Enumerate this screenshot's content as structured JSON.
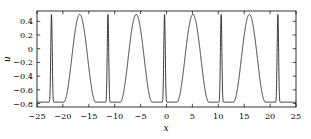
{
  "chart_data": {
    "type": "line",
    "title": "",
    "xlabel": "x",
    "ylabel": "u",
    "xlim": [
      -25,
      25
    ],
    "ylim": [
      -0.85,
      0.55
    ],
    "grid": false,
    "legend": false,
    "xticks": [
      -25,
      -20,
      -15,
      -10,
      -5,
      0,
      5,
      10,
      15,
      20,
      25
    ],
    "xticklabels": [
      "−25",
      "−20",
      "−15",
      "−10",
      "−5",
      "0",
      "5",
      "10",
      "15",
      "20",
      "25"
    ],
    "yticks": [
      0.4,
      0.2,
      0,
      -0.2,
      -0.4,
      -0.6,
      -0.8
    ],
    "yticklabels": [
      "0.4",
      "0.2",
      "0",
      "−0.2",
      "−0.4",
      "−0.6",
      "−0.8"
    ],
    "series": [
      {
        "name": "u(x)",
        "color": "#1a1a1a",
        "description": "Periodic two-peak travelling wave: alternating narrow cusp-like spikes and broad rounded crests",
        "period": 10.93,
        "peak_value": 0.5,
        "trough_value": -0.78,
        "narrow_peak_positions": [
          -22.2,
          -11.3,
          -0.38,
          10.55,
          21.5
        ],
        "narrow_peak_halfwidth": 0.55,
        "broad_peak_positions": [
          -16.75,
          -5.85,
          5.1,
          16.0
        ],
        "broad_peak_halfwidth": 3.1,
        "trough_positions": [
          -23.6,
          -20.3,
          -13.0,
          -9.1,
          -2.1,
          1.7,
          8.8,
          12.7,
          19.8,
          23.2
        ]
      }
    ]
  },
  "axes": {
    "x_axis_label": "x",
    "y_axis_label": "u"
  }
}
